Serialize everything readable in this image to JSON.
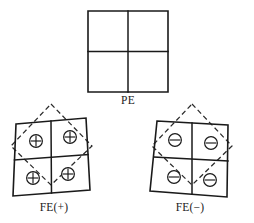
{
  "figure": {
    "background_color": "#ffffff",
    "line_color": "#1a1a1a",
    "dashed_color": "#2a2a2a",
    "panels": [
      {
        "id": "pe",
        "label": "PE",
        "label_x": 128,
        "label_y": 104,
        "shape": "square",
        "outline": "88,11 168,11 168,92 88,92",
        "divider_vertical": "128,11 128,92",
        "divider_horizontal": "88,51.5 168,51.5",
        "has_dashed_overlay": false,
        "charges": []
      },
      {
        "id": "fe-plus",
        "label": "FE(+)",
        "label_x": 54,
        "label_y": 211,
        "shape": "parallelogram-right-lean",
        "outline": "16,124 86,118 90,190 13,196",
        "divider_vertical": "51,121 51.5,193",
        "divider_horizontal": "14.5,160 88,154.5",
        "dashed_diamond": "51,104 92,146 51,185 11,146",
        "has_dashed_overlay": true,
        "charge_sign": "+",
        "charges": [
          {
            "sign": "+",
            "cx": 36,
            "cy": 141,
            "r": 6.4,
            "cell": "top-left"
          },
          {
            "sign": "+",
            "cx": 70,
            "cy": 137,
            "r": 6.4,
            "cell": "top-right"
          },
          {
            "sign": "+",
            "cx": 33,
            "cy": 178,
            "r": 6.4,
            "cell": "bottom-left"
          },
          {
            "sign": "+",
            "cx": 68,
            "cy": 174,
            "r": 6.4,
            "cell": "bottom-right"
          }
        ]
      },
      {
        "id": "fe-minus",
        "label": "FE(−)",
        "label_x": 190,
        "label_y": 211,
        "shape": "parallelogram-left-lean",
        "outline": "157,121 228,125 227,197 150,191",
        "divider_vertical": "192,123 192,194",
        "divider_horizontal": "154,157 228,161",
        "dashed_diamond": "192,104 232,146 192,185 152,146",
        "has_dashed_overlay": true,
        "charge_sign": "−",
        "charges": [
          {
            "sign": "−",
            "cx": 175,
            "cy": 140,
            "r": 6.4,
            "cell": "top-left"
          },
          {
            "sign": "−",
            "cx": 211,
            "cy": 143,
            "r": 6.4,
            "cell": "top-right"
          },
          {
            "sign": "−",
            "cx": 174,
            "cy": 177,
            "r": 6.4,
            "cell": "bottom-left"
          },
          {
            "sign": "−",
            "cx": 210,
            "cy": 180,
            "r": 6.4,
            "cell": "bottom-right"
          }
        ]
      }
    ]
  }
}
